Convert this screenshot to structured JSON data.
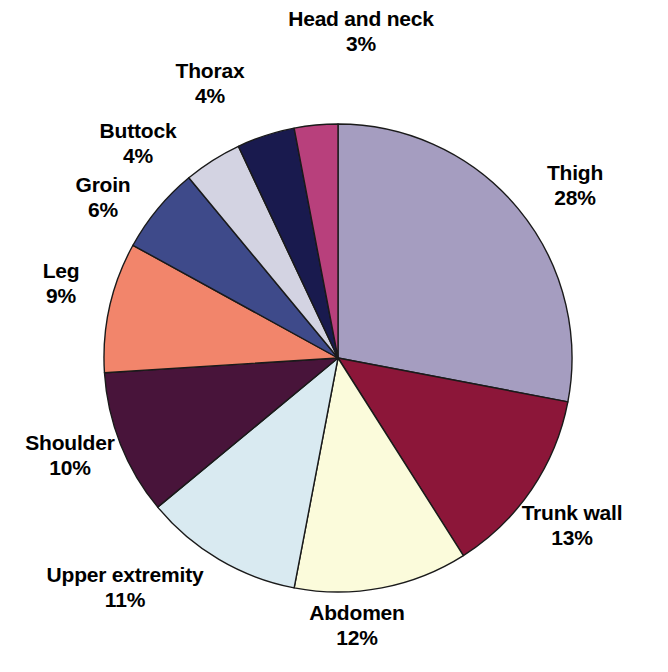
{
  "chart_data": {
    "type": "pie",
    "title": "",
    "subtitle": "",
    "xlabel": "",
    "ylabel": "",
    "legend_position": "none",
    "grid": false,
    "labels_show_name": true,
    "labels_show_percent": true,
    "start_angle_deg": 0,
    "direction": "clockwise",
    "total_percent": 100,
    "categories": [
      "Thigh",
      "Trunk wall",
      "Abdomen",
      "Upper extremity",
      "Shoulder",
      "Leg",
      "Groin",
      "Buttock",
      "Thorax",
      "Head and neck"
    ],
    "values": [
      28,
      13,
      12,
      11,
      10,
      9,
      6,
      4,
      4,
      3
    ],
    "value_labels": [
      "28%",
      "13%",
      "12%",
      "11%",
      "10%",
      "9%",
      "6%",
      "4%",
      "4%",
      "3%"
    ],
    "colors": [
      "#a59dc0",
      "#8c1639",
      "#fbfbdb",
      "#d9eaf1",
      "#48143a",
      "#f2856b",
      "#3e4a8a",
      "#d3d3e2",
      "#191a4e",
      "#b8407c"
    ],
    "slice_border_color": "#1a1a1a",
    "slices": [
      {
        "name": "Thigh",
        "percent": 28,
        "percent_label": "28%",
        "color": "#a59dc0"
      },
      {
        "name": "Trunk wall",
        "percent": 13,
        "percent_label": "13%",
        "color": "#8c1639"
      },
      {
        "name": "Abdomen",
        "percent": 12,
        "percent_label": "12%",
        "color": "#fbfbdb"
      },
      {
        "name": "Upper extremity",
        "percent": 11,
        "percent_label": "11%",
        "color": "#d9eaf1"
      },
      {
        "name": "Shoulder",
        "percent": 10,
        "percent_label": "10%",
        "color": "#48143a"
      },
      {
        "name": "Leg",
        "percent": 9,
        "percent_label": "9%",
        "color": "#f2856b"
      },
      {
        "name": "Groin",
        "percent": 6,
        "percent_label": "6%",
        "color": "#3e4a8a"
      },
      {
        "name": "Buttock",
        "percent": 4,
        "percent_label": "4%",
        "color": "#d3d3e2"
      },
      {
        "name": "Thorax",
        "percent": 4,
        "percent_label": "4%",
        "color": "#191a4e"
      },
      {
        "name": "Head and neck",
        "percent": 3,
        "percent_label": "3%",
        "color": "#b8407c"
      }
    ]
  },
  "geometry": {
    "center_x": 338,
    "center_y": 358,
    "radius": 234
  },
  "labels": [
    {
      "name": "Head and neck",
      "percent_label": "3%",
      "x": 246,
      "y": 6,
      "width": 230,
      "align": "center"
    },
    {
      "name": "Thorax",
      "percent_label": "4%",
      "x": 120,
      "y": 58,
      "width": 180,
      "align": "center"
    },
    {
      "name": "Buttock",
      "percent_label": "4%",
      "x": 48,
      "y": 118,
      "width": 180,
      "align": "center"
    },
    {
      "name": "Groin",
      "percent_label": "6%",
      "x": 28,
      "y": 172,
      "width": 150,
      "align": "center"
    },
    {
      "name": "Leg",
      "percent_label": "9%",
      "x": 6,
      "y": 258,
      "width": 110,
      "align": "center"
    },
    {
      "name": "Shoulder",
      "percent_label": "10%",
      "x": 0,
      "y": 430,
      "width": 140,
      "align": "center"
    },
    {
      "name": "Upper extremity",
      "percent_label": "11%",
      "x": 0,
      "y": 562,
      "width": 250,
      "align": "center"
    },
    {
      "name": "Abdomen",
      "percent_label": "12%",
      "x": 272,
      "y": 600,
      "width": 170,
      "align": "center"
    },
    {
      "name": "Trunk wall",
      "percent_label": "13%",
      "x": 482,
      "y": 500,
      "width": 180,
      "align": "center"
    },
    {
      "name": "Thigh",
      "percent_label": "28%",
      "x": 500,
      "y": 160,
      "width": 150,
      "align": "center"
    }
  ]
}
